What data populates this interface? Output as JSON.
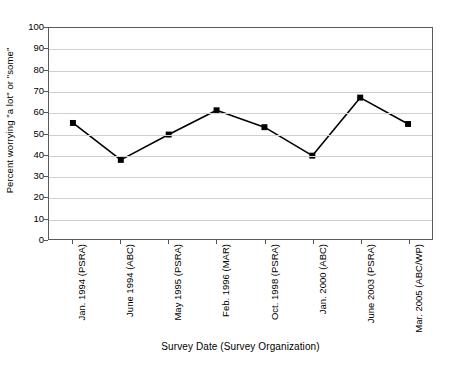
{
  "chart_data": {
    "type": "line",
    "title": "",
    "xlabel": "Survey Date (Survey Organization)",
    "ylabel": "Percent worrying \"a lot\" or \"some\"",
    "categories": [
      "Jan. 1994 (PSRA)",
      "June 1994 (ABC)",
      "May 1995 (PSRA)",
      "Feb. 1996 (MAR)",
      "Oct. 1998 (PSRA)",
      "Jan. 2000 (ABC)",
      "June 2003 (PSRA)",
      "Mar. 2005 (ABC/WP)"
    ],
    "values": [
      55,
      37.5,
      49.5,
      61,
      53,
      39.5,
      67,
      54.5
    ],
    "ylim": [
      0,
      100
    ],
    "ytick_step": 10,
    "ytick_labels": [
      "100",
      "90",
      "80",
      "70",
      "60",
      "50",
      "40",
      "30",
      "20",
      "10",
      "0"
    ],
    "grid": true,
    "grid_axis": "y",
    "legend": "none",
    "marker": "square",
    "series_color": "#000000",
    "grid_color": "#d0d0d0",
    "axis_color": "#595959"
  }
}
